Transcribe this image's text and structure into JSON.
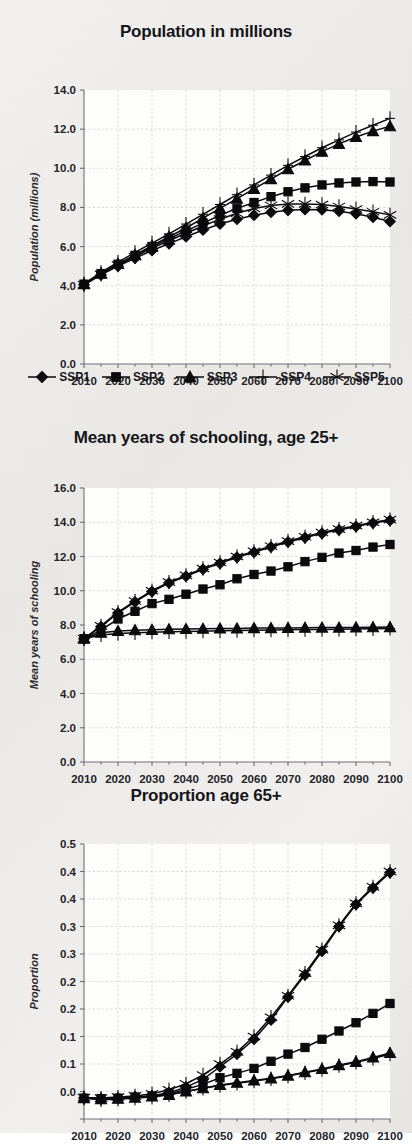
{
  "figure": {
    "background_color": "#f2f1ef",
    "ink_color": "#0b0b0e",
    "panel_count": 3
  },
  "legend": {
    "position": "below-first-panel",
    "entries": [
      {
        "label": "SSP1",
        "marker": "diamond"
      },
      {
        "label": "SSP2",
        "marker": "square"
      },
      {
        "label": "SSP3",
        "marker": "triangle"
      },
      {
        "label": "SSP4",
        "marker": "plus"
      },
      {
        "label": "SSP5",
        "marker": "asterisk"
      }
    ]
  },
  "chart_data": [
    {
      "id": "population",
      "type": "line",
      "title": "Population in millions",
      "xlabel": "",
      "ylabel": "Population (millions)",
      "xlim": [
        2010,
        2100
      ],
      "ylim": [
        0.0,
        14.0
      ],
      "ytick_step": 2.0,
      "yticks": [
        "14.0",
        "12.0",
        "10.0",
        "8.0",
        "6.0",
        "4.0",
        "2.0",
        "0.0"
      ],
      "xticks": [
        "2010",
        "2020",
        "2030",
        "2040",
        "2050",
        "2060",
        "2070",
        "2080",
        "2090",
        "2100"
      ],
      "x": [
        2010,
        2015,
        2020,
        2025,
        2030,
        2035,
        2040,
        2045,
        2050,
        2055,
        2060,
        2065,
        2070,
        2075,
        2080,
        2085,
        2090,
        2095,
        2100
      ],
      "grid": true,
      "legend_position": "bottom",
      "series": [
        {
          "name": "SSP1",
          "marker": "diamond",
          "values": [
            4.05,
            4.55,
            5.0,
            5.4,
            5.8,
            6.15,
            6.5,
            6.85,
            7.15,
            7.4,
            7.6,
            7.75,
            7.85,
            7.9,
            7.88,
            7.8,
            7.68,
            7.5,
            7.28
          ]
        },
        {
          "name": "SSP2",
          "marker": "square",
          "values": [
            4.08,
            4.62,
            5.1,
            5.55,
            6.0,
            6.4,
            6.8,
            7.2,
            7.6,
            7.95,
            8.25,
            8.55,
            8.8,
            9.0,
            9.15,
            9.25,
            9.3,
            9.32,
            9.3
          ]
        },
        {
          "name": "SSP3",
          "marker": "triangle",
          "values": [
            4.08,
            4.62,
            5.12,
            5.58,
            6.05,
            6.5,
            6.95,
            7.45,
            7.95,
            8.45,
            8.95,
            9.45,
            9.95,
            10.4,
            10.85,
            11.25,
            11.6,
            11.9,
            12.15
          ]
        },
        {
          "name": "SSP4",
          "marker": "plus",
          "values": [
            4.1,
            4.68,
            5.2,
            5.7,
            6.18,
            6.65,
            7.15,
            7.65,
            8.15,
            8.65,
            9.15,
            9.65,
            10.15,
            10.6,
            11.05,
            11.45,
            11.85,
            12.2,
            12.55
          ]
        },
        {
          "name": "SSP5",
          "marker": "asterisk",
          "values": [
            4.05,
            4.58,
            5.05,
            5.48,
            5.92,
            6.3,
            6.68,
            7.05,
            7.4,
            7.7,
            7.95,
            8.1,
            8.18,
            8.18,
            8.15,
            8.05,
            7.92,
            7.78,
            7.62
          ]
        }
      ]
    },
    {
      "id": "schooling",
      "type": "line",
      "title": "Mean years of schooling, age 25+",
      "xlabel": "",
      "ylabel": "Mean years of schooling",
      "xlim": [
        2010,
        2100
      ],
      "ylim": [
        0.0,
        16.0
      ],
      "ytick_step": 2.0,
      "yticks": [
        "16.0",
        "14.0",
        "12.0",
        "10.0",
        "8.0",
        "6.0",
        "4.0",
        "2.0",
        "0.0"
      ],
      "xticks": [
        "2010",
        "2020",
        "2030",
        "2040",
        "2050",
        "2060",
        "2070",
        "2080",
        "2090",
        "2100"
      ],
      "x": [
        2010,
        2015,
        2020,
        2025,
        2030,
        2035,
        2040,
        2045,
        2050,
        2055,
        2060,
        2065,
        2070,
        2075,
        2080,
        2085,
        2090,
        2095,
        2100
      ],
      "grid": true,
      "legend_position": "none",
      "series": [
        {
          "name": "SSP1",
          "marker": "diamond",
          "values": [
            7.2,
            7.9,
            8.7,
            9.35,
            9.95,
            10.45,
            10.85,
            11.25,
            11.6,
            11.95,
            12.25,
            12.55,
            12.85,
            13.1,
            13.35,
            13.55,
            13.75,
            13.95,
            14.1
          ]
        },
        {
          "name": "SSP2",
          "marker": "square",
          "values": [
            7.2,
            7.7,
            8.35,
            8.8,
            9.25,
            9.5,
            9.8,
            10.1,
            10.35,
            10.7,
            10.95,
            11.15,
            11.4,
            11.7,
            11.95,
            12.2,
            12.35,
            12.55,
            12.7
          ]
        },
        {
          "name": "SSP3",
          "marker": "triangle",
          "values": [
            7.2,
            7.55,
            7.65,
            7.7,
            7.72,
            7.75,
            7.77,
            7.78,
            7.8,
            7.8,
            7.82,
            7.82,
            7.83,
            7.84,
            7.85,
            7.85,
            7.86,
            7.87,
            7.88
          ]
        },
        {
          "name": "SSP4",
          "marker": "plus",
          "values": [
            7.2,
            7.42,
            7.5,
            7.55,
            7.58,
            7.6,
            7.62,
            7.64,
            7.66,
            7.68,
            7.7,
            7.71,
            7.72,
            7.73,
            7.74,
            7.75,
            7.76,
            7.78,
            7.8
          ]
        },
        {
          "name": "SSP5",
          "marker": "asterisk",
          "values": [
            7.2,
            7.95,
            8.75,
            9.4,
            10.0,
            10.5,
            10.9,
            11.3,
            11.65,
            12.0,
            12.3,
            12.6,
            12.9,
            13.15,
            13.4,
            13.6,
            13.8,
            14.0,
            14.15
          ]
        }
      ]
    },
    {
      "id": "proportion65",
      "type": "line",
      "title": "Proportion age 65+",
      "xlabel": "",
      "ylabel": "Proportion",
      "xlim": [
        2010,
        2100
      ],
      "ylim": [
        0.0,
        0.5
      ],
      "ytick_step": 0.05,
      "yticks": [
        "0.5",
        "0.4",
        "0.4",
        "0.3",
        "0.3",
        "0.2",
        "0.2",
        "0.1",
        "0.1",
        "0.0"
      ],
      "ytick_values": [
        0.5,
        0.45,
        0.4,
        0.35,
        0.3,
        0.25,
        0.2,
        0.15,
        0.1,
        0.05,
        0.0
      ],
      "xticks": [
        "2010",
        "2020",
        "2030",
        "2040",
        "2050",
        "2060",
        "2070",
        "2080",
        "2090",
        "2100"
      ],
      "x": [
        2010,
        2015,
        2020,
        2025,
        2030,
        2035,
        2040,
        2045,
        2050,
        2055,
        2060,
        2065,
        2070,
        2075,
        2080,
        2085,
        2090,
        2095,
        2100
      ],
      "grid": true,
      "legend_position": "none",
      "series": [
        {
          "name": "SSP1",
          "marker": "diamond",
          "values": [
            0.038,
            0.037,
            0.038,
            0.04,
            0.042,
            0.048,
            0.058,
            0.072,
            0.095,
            0.118,
            0.145,
            0.18,
            0.222,
            0.262,
            0.305,
            0.35,
            0.39,
            0.42,
            0.448
          ]
        },
        {
          "name": "SSP2",
          "marker": "square",
          "values": [
            0.038,
            0.037,
            0.038,
            0.04,
            0.042,
            0.046,
            0.054,
            0.063,
            0.075,
            0.083,
            0.092,
            0.105,
            0.118,
            0.13,
            0.145,
            0.16,
            0.175,
            0.192,
            0.21
          ]
        },
        {
          "name": "SSP3",
          "marker": "triangle",
          "values": [
            0.038,
            0.036,
            0.037,
            0.039,
            0.041,
            0.044,
            0.05,
            0.056,
            0.062,
            0.066,
            0.07,
            0.074,
            0.079,
            0.085,
            0.091,
            0.098,
            0.104,
            0.112,
            0.12
          ]
        },
        {
          "name": "SSP4",
          "marker": "plus",
          "values": [
            0.038,
            0.035,
            0.036,
            0.038,
            0.04,
            0.044,
            0.05,
            0.056,
            0.061,
            0.065,
            0.069,
            0.073,
            0.078,
            0.084,
            0.09,
            0.097,
            0.103,
            0.11,
            0.118
          ]
        },
        {
          "name": "SSP5",
          "marker": "asterisk",
          "values": [
            0.039,
            0.038,
            0.04,
            0.042,
            0.046,
            0.053,
            0.064,
            0.08,
            0.1,
            0.122,
            0.15,
            0.185,
            0.224,
            0.265,
            0.308,
            0.352,
            0.392,
            0.422,
            0.45
          ]
        }
      ]
    }
  ]
}
